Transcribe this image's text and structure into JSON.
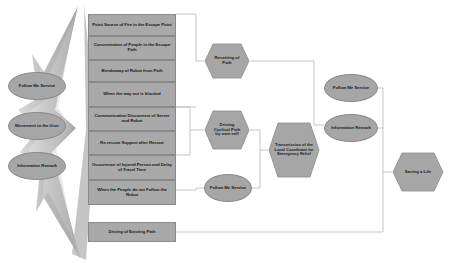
{
  "diagram": {
    "colors": {
      "node_fill": "#a9a9a9",
      "node_stroke": "#8a8a8a",
      "ellipse_fill": "#a6a6a6",
      "connector": "#b4b4b4",
      "flame_fill": "#b0b0b0",
      "background": "#ffffff",
      "text": "#1c1c1c"
    },
    "left_services": [
      {
        "label": "Follow Me Service",
        "shape": "ellipse"
      },
      {
        "label": "Movement to the User",
        "shape": "ellipse"
      },
      {
        "label": "Information Remark",
        "shape": "ellipse"
      }
    ],
    "event_boxes": [
      {
        "label": "Point Source of Fire in the Escape Point",
        "shape": "rect"
      },
      {
        "label": "Concentration of People in the Escape Path",
        "shape": "rect"
      },
      {
        "label": "Breakaway of Robot from Path",
        "shape": "rect"
      },
      {
        "label": "When the way out is blocked",
        "shape": "rect"
      },
      {
        "label": "Communication Disconnect of Server and Robot",
        "shape": "rect"
      },
      {
        "label": "Re-rescue Support after Rescue",
        "shape": "rect"
      },
      {
        "label": "Occurrence of Injured Person and Delay of Travel Time",
        "shape": "rect"
      },
      {
        "label": "When the People do not Follow the Robot",
        "shape": "rect"
      }
    ],
    "existing_path_box": {
      "label": "Driving of Existing Path",
      "shape": "rect"
    },
    "actions": [
      {
        "label": "Resetting of Path",
        "shape": "hexagon"
      },
      {
        "label": "Driving Cyclical Path by own self",
        "shape": "hexagon"
      },
      {
        "label": "Follow Me Service",
        "shape": "ellipse"
      }
    ],
    "transmission": {
      "label": "Transmission of the Local Coordinate for Emergency Relief",
      "shape": "hexagon"
    },
    "right_services": [
      {
        "label": "Follow Me Service",
        "shape": "ellipse"
      },
      {
        "label": "Information Remark",
        "shape": "ellipse"
      }
    ],
    "outcome": {
      "label": "Saving a Life",
      "shape": "hexagon"
    }
  }
}
